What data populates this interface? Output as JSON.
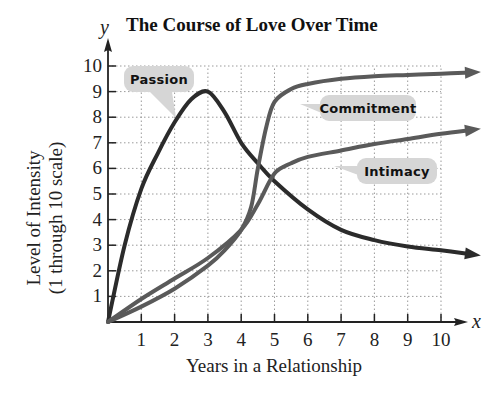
{
  "chart_data": {
    "type": "line",
    "title": "The Course of Love Over Time",
    "xlabel": "Years in a Relationship",
    "ylabel": "Level of Intensity",
    "ylabel_sub": "(1 through 10 scale)",
    "x_axis_letter": "x",
    "y_axis_letter": "y",
    "xlim": [
      0,
      10
    ],
    "ylim": [
      0,
      10
    ],
    "x_ticks": [
      "1",
      "2",
      "3",
      "4",
      "5",
      "6",
      "7",
      "8",
      "9",
      "10"
    ],
    "y_ticks": [
      "1",
      "2",
      "3",
      "4",
      "5",
      "6",
      "7",
      "8",
      "9",
      "10"
    ],
    "grid": true,
    "legend_position": "callouts",
    "series": [
      {
        "name": "Passion",
        "color": "#2b2b2b",
        "points": [
          [
            0,
            0
          ],
          [
            0.5,
            3.0
          ],
          [
            1,
            5.2
          ],
          [
            1.5,
            6.6
          ],
          [
            2,
            7.8
          ],
          [
            2.5,
            8.7
          ],
          [
            3,
            9.0
          ],
          [
            3.5,
            8.2
          ],
          [
            4,
            7.0
          ],
          [
            4.5,
            6.2
          ],
          [
            5,
            5.5
          ],
          [
            6,
            4.4
          ],
          [
            7,
            3.6
          ],
          [
            8,
            3.2
          ],
          [
            9,
            2.95
          ],
          [
            10,
            2.8
          ],
          [
            10.9,
            2.65
          ]
        ]
      },
      {
        "name": "Commitment",
        "color": "#5a5a5a",
        "points": [
          [
            0,
            0
          ],
          [
            1,
            0.6
          ],
          [
            2,
            1.3
          ],
          [
            3,
            2.2
          ],
          [
            3.5,
            2.8
          ],
          [
            4,
            3.6
          ],
          [
            4.3,
            4.5
          ],
          [
            4.5,
            6.0
          ],
          [
            4.75,
            7.6
          ],
          [
            5,
            8.6
          ],
          [
            5.5,
            9.1
          ],
          [
            6,
            9.3
          ],
          [
            7,
            9.5
          ],
          [
            8,
            9.6
          ],
          [
            9,
            9.65
          ],
          [
            10,
            9.7
          ],
          [
            10.9,
            9.75
          ]
        ]
      },
      {
        "name": "Intimacy",
        "color": "#5a5a5a",
        "points": [
          [
            0,
            0
          ],
          [
            1,
            0.9
          ],
          [
            2,
            1.7
          ],
          [
            3,
            2.5
          ],
          [
            4,
            3.6
          ],
          [
            4.5,
            4.6
          ],
          [
            5,
            5.8
          ],
          [
            5.5,
            6.2
          ],
          [
            6,
            6.45
          ],
          [
            7,
            6.7
          ],
          [
            8,
            6.95
          ],
          [
            9,
            7.15
          ],
          [
            10,
            7.35
          ],
          [
            10.9,
            7.5
          ]
        ]
      }
    ],
    "annotations": [
      {
        "text": "Passion",
        "target_series": "Passion"
      },
      {
        "text": "Commitment",
        "target_series": "Commitment"
      },
      {
        "text": "Intimacy",
        "target_series": "Intimacy"
      }
    ]
  }
}
